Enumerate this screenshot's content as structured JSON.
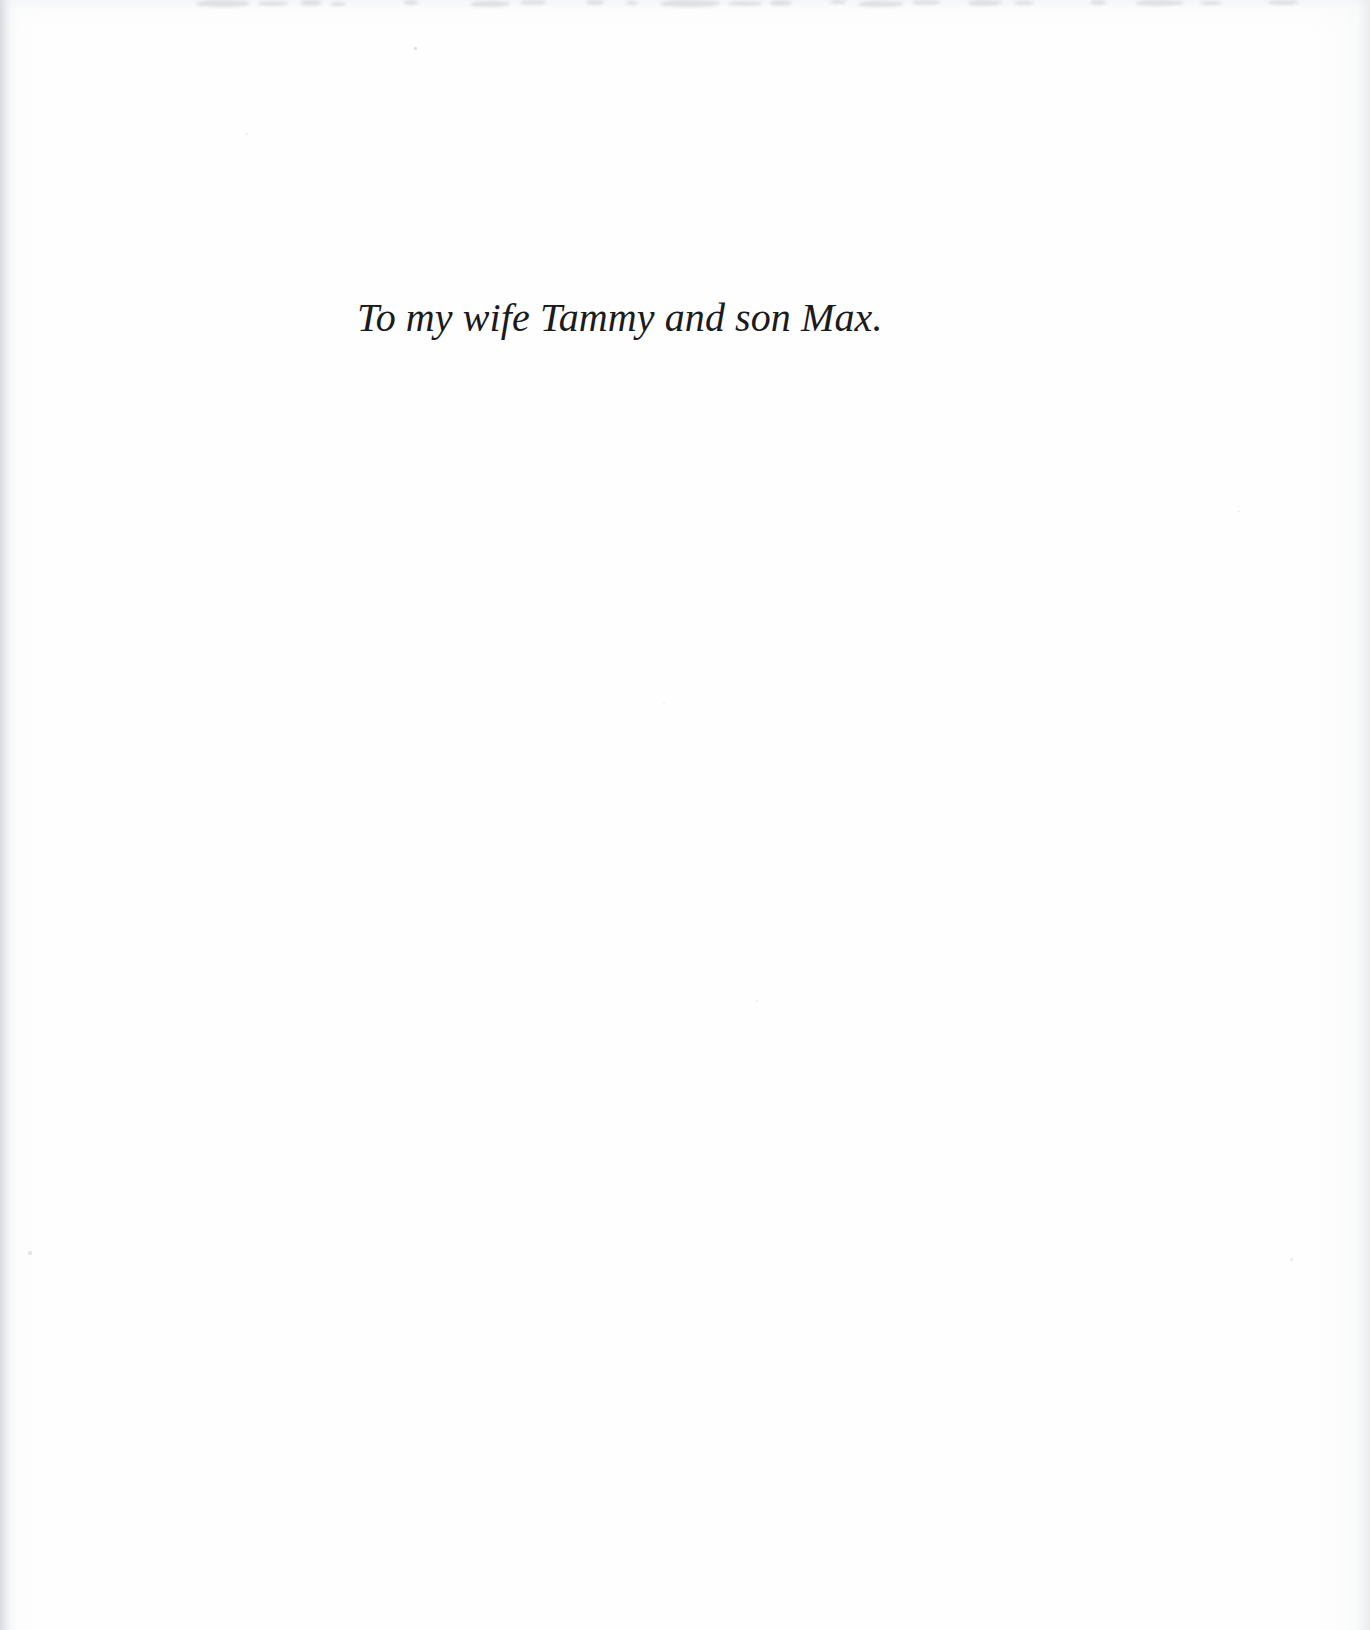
{
  "page": {
    "kind": "book-dedication-page",
    "background_color": "#fefefe",
    "text_color": "#1b1b1d"
  },
  "dedication": {
    "text": "To my wife Tammy and son Max."
  },
  "artifacts": {
    "top_smudges": [
      {
        "left": 196,
        "top": 0,
        "width": 54,
        "height": 7
      },
      {
        "left": 258,
        "top": 1,
        "width": 30,
        "height": 5
      },
      {
        "left": 300,
        "top": 0,
        "width": 22,
        "height": 6
      },
      {
        "left": 330,
        "top": 2,
        "width": 16,
        "height": 4
      },
      {
        "left": 404,
        "top": 0,
        "width": 14,
        "height": 5
      },
      {
        "left": 470,
        "top": 1,
        "width": 40,
        "height": 6
      },
      {
        "left": 520,
        "top": 0,
        "width": 26,
        "height": 5
      },
      {
        "left": 586,
        "top": 0,
        "width": 18,
        "height": 5
      },
      {
        "left": 626,
        "top": 1,
        "width": 12,
        "height": 4
      },
      {
        "left": 660,
        "top": 0,
        "width": 60,
        "height": 7
      },
      {
        "left": 728,
        "top": 1,
        "width": 34,
        "height": 5
      },
      {
        "left": 770,
        "top": 0,
        "width": 22,
        "height": 6
      },
      {
        "left": 830,
        "top": 0,
        "width": 16,
        "height": 4
      },
      {
        "left": 858,
        "top": 1,
        "width": 46,
        "height": 6
      },
      {
        "left": 912,
        "top": 0,
        "width": 28,
        "height": 5
      },
      {
        "left": 968,
        "top": 0,
        "width": 34,
        "height": 6
      },
      {
        "left": 1014,
        "top": 1,
        "width": 20,
        "height": 4
      },
      {
        "left": 1090,
        "top": 0,
        "width": 16,
        "height": 5
      },
      {
        "left": 1136,
        "top": 0,
        "width": 48,
        "height": 6
      },
      {
        "left": 1200,
        "top": 1,
        "width": 22,
        "height": 4
      },
      {
        "left": 1268,
        "top": 0,
        "width": 30,
        "height": 5
      }
    ],
    "specks": [
      {
        "left": 414,
        "top": 47,
        "size": 3,
        "opacity": 0.45
      },
      {
        "left": 28,
        "top": 1251,
        "size": 4,
        "opacity": 0.4
      },
      {
        "left": 1290,
        "top": 1258,
        "size": 3,
        "opacity": 0.28
      },
      {
        "left": 246,
        "top": 133,
        "size": 2,
        "opacity": 0.25
      },
      {
        "left": 756,
        "top": 1000,
        "size": 2,
        "opacity": 0.22
      },
      {
        "left": 1238,
        "top": 510,
        "size": 2,
        "opacity": 0.22
      },
      {
        "left": 663,
        "top": 702,
        "size": 2,
        "opacity": 0.18
      }
    ]
  }
}
